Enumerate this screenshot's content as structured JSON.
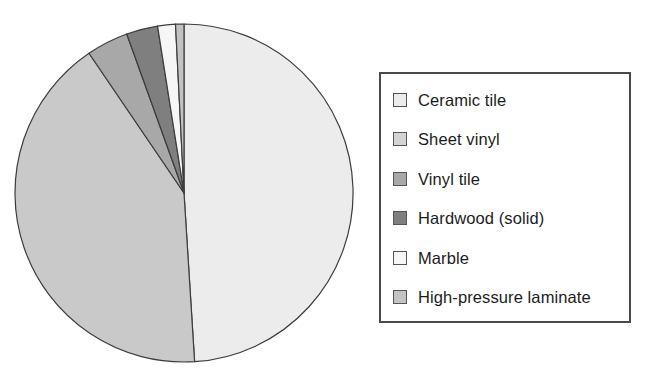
{
  "chart_data": {
    "type": "pie",
    "title": "",
    "legend_position": "right",
    "grid": false,
    "categories": [
      "Ceramic tile",
      "Sheet vinyl",
      "Vinyl tile",
      "Hardwood (solid)",
      "Marble",
      "High-pressure laminate"
    ],
    "values": [
      49.0,
      41.5,
      4.0,
      3.0,
      1.7,
      0.8
    ],
    "colors": [
      "#ececec",
      "#c9c9c9",
      "#a8a8a8",
      "#7f7f7f",
      "#f6f6f6",
      "#c2c2c2"
    ],
    "slice_border_color": "#3d3d3d",
    "start_angle_deg": 0,
    "direction": "clockwise"
  },
  "legend": {
    "border_color": "#4a4a4a",
    "background": "#ffffff",
    "items": [
      {
        "label": "Ceramic tile",
        "color": "#ececec"
      },
      {
        "label": "Sheet vinyl",
        "color": "#d3d3d3"
      },
      {
        "label": "Vinyl tile",
        "color": "#a8a8a8"
      },
      {
        "label": "Hardwood (solid)",
        "color": "#7f7f7f"
      },
      {
        "label": "Marble",
        "color": "#f7f7f7"
      },
      {
        "label": "High-pressure laminate",
        "color": "#c4c4c4"
      }
    ]
  }
}
